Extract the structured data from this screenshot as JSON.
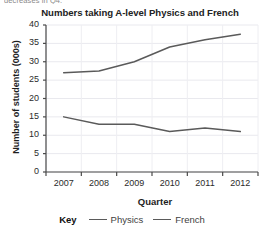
{
  "page": {
    "clipped_text_above": "decreases in Q4."
  },
  "chart_data": {
    "type": "line",
    "title": "Numbers taking A-level Physics and French",
    "xlabel": "Quarter",
    "ylabel": "Number of students (000s)",
    "categories": [
      "2007",
      "2008",
      "2009",
      "2010",
      "2011",
      "2012"
    ],
    "yticks": [
      0,
      5,
      10,
      15,
      20,
      25,
      30,
      35,
      40
    ],
    "ylim": [
      0,
      40
    ],
    "grid": true,
    "legend_position": "bottom",
    "legend_title": "Key",
    "series": [
      {
        "name": "Physics",
        "values": [
          15,
          13,
          13,
          11,
          12,
          11
        ],
        "color": "#5a5a5a"
      },
      {
        "name": "French",
        "values": [
          27,
          27.5,
          30,
          34,
          36,
          37.5
        ],
        "color": "#5a5a5a"
      }
    ]
  }
}
